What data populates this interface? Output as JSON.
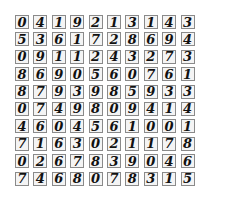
{
  "grid": {
    "rows": 10,
    "cols": 10,
    "digits": [
      [
        "0",
        "4",
        "1",
        "9",
        "2",
        "1",
        "3",
        "1",
        "4",
        "3"
      ],
      [
        "5",
        "3",
        "6",
        "1",
        "7",
        "2",
        "8",
        "6",
        "9",
        "4"
      ],
      [
        "0",
        "9",
        "1",
        "1",
        "2",
        "4",
        "3",
        "2",
        "7",
        "3"
      ],
      [
        "8",
        "6",
        "9",
        "0",
        "5",
        "6",
        "0",
        "7",
        "6",
        "1"
      ],
      [
        "8",
        "7",
        "9",
        "3",
        "9",
        "8",
        "5",
        "9",
        "3",
        "3"
      ],
      [
        "0",
        "7",
        "4",
        "9",
        "8",
        "0",
        "9",
        "4",
        "1",
        "4"
      ],
      [
        "4",
        "6",
        "0",
        "4",
        "5",
        "6",
        "1",
        "0",
        "0",
        "1"
      ],
      [
        "7",
        "1",
        "6",
        "3",
        "0",
        "2",
        "1",
        "1",
        "7",
        "8"
      ],
      [
        "0",
        "2",
        "6",
        "7",
        "8",
        "3",
        "9",
        "0",
        "4",
        "6"
      ],
      [
        "7",
        "4",
        "6",
        "8",
        "0",
        "7",
        "8",
        "3",
        "1",
        "5"
      ]
    ]
  },
  "colors": {
    "background": "#ffffff",
    "cell_border": "#8a8a8a",
    "cell_fill": "#f4f4f4",
    "ink": "#111111"
  }
}
